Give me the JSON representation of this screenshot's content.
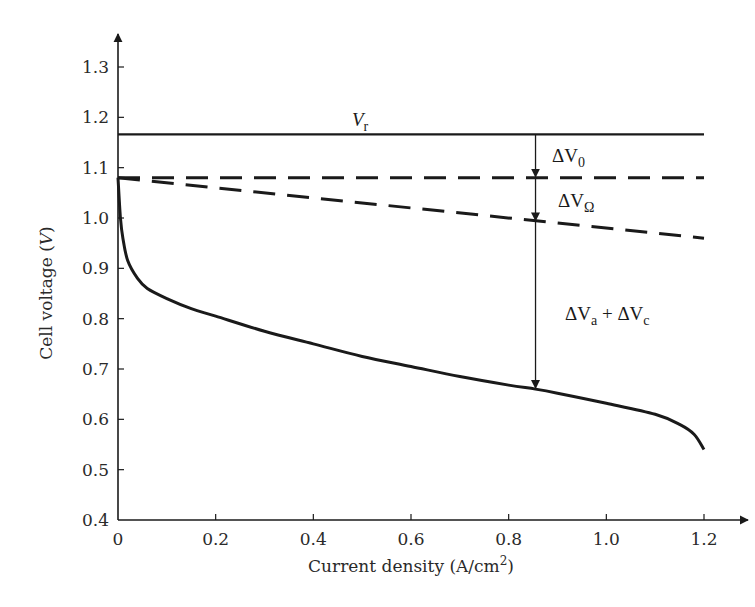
{
  "chart_data": {
    "type": "line",
    "title": "",
    "xlabel": "Current density (A/cm2)",
    "xlabel_main": "Current density (A/cm",
    "xlabel_sup": "2",
    "xlabel_tail": ")",
    "ylabel": "Cell voltage (V)",
    "ylabel_main": "Cell voltage (",
    "ylabel_var": "V",
    "ylabel_tail": ")",
    "xlim": [
      0,
      1.2
    ],
    "ylim": [
      0.4,
      1.3
    ],
    "x_ticks": [
      "0",
      "0.2",
      "0.4",
      "0.6",
      "0.8",
      "1.0",
      "1.2"
    ],
    "y_ticks": [
      "0.4",
      "0.5",
      "0.6",
      "0.7",
      "0.8",
      "0.9",
      "1.0",
      "1.1",
      "1.2",
      "1.3"
    ],
    "grid": false,
    "legend": "none",
    "series": [
      {
        "name": "Vr (reversible voltage)",
        "style": "solid",
        "x": [
          0,
          1.2
        ],
        "y": [
          1.166,
          1.166
        ]
      },
      {
        "name": "Open-circuit voltage (after ΔV0)",
        "style": "dashed",
        "x": [
          0,
          1.2
        ],
        "y": [
          1.08,
          1.08
        ]
      },
      {
        "name": "After ohmic loss (ΔVΩ)",
        "style": "dashed",
        "x": [
          0,
          1.2
        ],
        "y": [
          1.08,
          0.96
        ]
      },
      {
        "name": "Cell voltage (polarization curve)",
        "style": "solid",
        "x": [
          0,
          0.005,
          0.01,
          0.02,
          0.04,
          0.06,
          0.1,
          0.15,
          0.2,
          0.3,
          0.4,
          0.5,
          0.6,
          0.7,
          0.8,
          0.855,
          0.9,
          1.0,
          1.1,
          1.15,
          1.18,
          1.2
        ],
        "y": [
          1.08,
          1.0,
          0.96,
          0.915,
          0.88,
          0.86,
          0.84,
          0.82,
          0.805,
          0.775,
          0.75,
          0.725,
          0.705,
          0.685,
          0.668,
          0.66,
          0.652,
          0.632,
          0.61,
          0.59,
          0.57,
          0.54
        ]
      }
    ],
    "annotations": [
      {
        "text": "Vr",
        "main": "V",
        "sub": "r",
        "x": 0.47,
        "y": 1.185
      },
      {
        "text": "ΔV0",
        "main": "ΔV",
        "sub": "0",
        "x": 0.89,
        "y": 1.125
      },
      {
        "text": "ΔVΩ",
        "main": "ΔV",
        "sub": "Ω",
        "x": 0.9,
        "y": 1.04
      },
      {
        "text": "ΔVa + ΔVc",
        "main1": "ΔV",
        "sub1": "a",
        "plus": " + ΔV",
        "sub2": "c",
        "x": 0.9,
        "y": 0.82
      }
    ],
    "arrow": {
      "x": 0.855,
      "segments": [
        [
          1.166,
          1.08
        ],
        [
          1.08,
          0.993
        ],
        [
          0.993,
          0.66
        ]
      ]
    }
  },
  "colors": {
    "line": "#1a1a1a",
    "background": "#ffffff",
    "text": "#2a2a2a"
  }
}
